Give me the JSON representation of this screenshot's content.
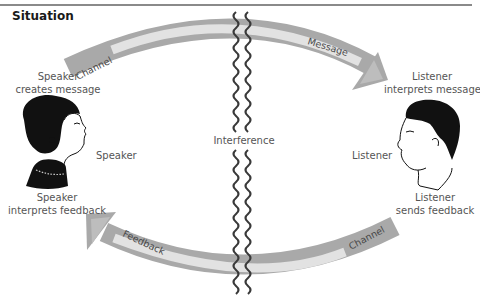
{
  "title": "Situation",
  "colors": {
    "channel_outer": "#a9a9a9",
    "channel_inner": "#e2e2e2",
    "interference_wave": "#3a3a3a",
    "text": "#555555",
    "title_text": "#1a1a1a",
    "rule": "#8a8a8a"
  },
  "speaker": {
    "creates_label_line1": "Speaker",
    "creates_label_line2": "creates message",
    "name_label": "Speaker",
    "feedback_label_line1": "Speaker",
    "feedback_label_line2": "interprets feedback",
    "icon": "woman-profile-icon"
  },
  "listener": {
    "interprets_label_line1": "Listener",
    "interprets_label_line2": "interprets message",
    "name_label": "Listener",
    "feedback_label_line1": "Listener",
    "feedback_label_line2": "sends feedback",
    "icon": "man-profile-icon"
  },
  "interference": {
    "label": "Interference"
  },
  "arrows": {
    "top": {
      "left_label": "Channel",
      "right_label": "Message",
      "direction": "speaker-to-listener"
    },
    "bottom": {
      "left_label": "Feedback",
      "right_label": "Channel",
      "direction": "listener-to-speaker"
    }
  }
}
